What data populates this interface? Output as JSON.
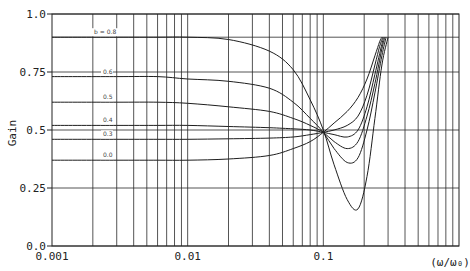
{
  "chart_data": {
    "type": "line",
    "title": "",
    "xlabel": "(ω/ω₀)",
    "ylabel": "Gain",
    "xscale": "log",
    "xlim": [
      0.001,
      1.0
    ],
    "ylim": [
      0.0,
      1.0
    ],
    "grid": true,
    "x_ticks": [
      {
        "value": 0.001,
        "label": "0.001"
      },
      {
        "value": 0.01,
        "label": "0.01"
      },
      {
        "value": 0.1,
        "label": "0.1"
      }
    ],
    "y_ticks": [
      {
        "value": 0.0,
        "label": "0.0"
      },
      {
        "value": 0.25,
        "label": "0.25"
      },
      {
        "value": 0.5,
        "label": "0.5"
      },
      {
        "value": 0.75,
        "label": "0.75"
      },
      {
        "value": 1.0,
        "label": "1.0"
      }
    ],
    "annotation_prefix": "b =",
    "series": [
      {
        "name": "b = 0.8",
        "label": "b = 0.8",
        "x": [
          0.001,
          0.003,
          0.006,
          0.01,
          0.02,
          0.04,
          0.06,
          0.08,
          0.1,
          0.12,
          0.15,
          0.18,
          0.21,
          0.24,
          0.27,
          0.3
        ],
        "y": [
          0.9,
          0.9,
          0.9,
          0.9,
          0.89,
          0.84,
          0.76,
          0.63,
          0.5,
          0.35,
          0.2,
          0.16,
          0.3,
          0.55,
          0.78,
          0.9
        ]
      },
      {
        "name": "b = 0.6",
        "label": "0.6",
        "x": [
          0.001,
          0.003,
          0.006,
          0.01,
          0.02,
          0.04,
          0.06,
          0.08,
          0.1,
          0.12,
          0.15,
          0.18,
          0.21,
          0.24,
          0.27,
          0.29
        ],
        "y": [
          0.73,
          0.73,
          0.73,
          0.72,
          0.71,
          0.68,
          0.62,
          0.55,
          0.49,
          0.42,
          0.36,
          0.38,
          0.5,
          0.66,
          0.82,
          0.9
        ]
      },
      {
        "name": "b = 0.5",
        "label": "0.5",
        "x": [
          0.001,
          0.003,
          0.006,
          0.01,
          0.02,
          0.04,
          0.06,
          0.08,
          0.1,
          0.12,
          0.15,
          0.18,
          0.21,
          0.24,
          0.27,
          0.285
        ],
        "y": [
          0.62,
          0.62,
          0.62,
          0.615,
          0.6,
          0.58,
          0.55,
          0.52,
          0.49,
          0.45,
          0.42,
          0.45,
          0.56,
          0.7,
          0.85,
          0.9
        ]
      },
      {
        "name": "b = 0.4",
        "label": "0.4",
        "x": [
          0.001,
          0.003,
          0.006,
          0.01,
          0.02,
          0.04,
          0.06,
          0.08,
          0.1,
          0.12,
          0.15,
          0.18,
          0.21,
          0.24,
          0.27,
          0.28
        ],
        "y": [
          0.52,
          0.52,
          0.52,
          0.52,
          0.515,
          0.51,
          0.505,
          0.5,
          0.49,
          0.48,
          0.47,
          0.5,
          0.6,
          0.74,
          0.87,
          0.9
        ]
      },
      {
        "name": "b = 0.3",
        "label": "0.3",
        "x": [
          0.001,
          0.003,
          0.006,
          0.01,
          0.02,
          0.04,
          0.06,
          0.08,
          0.1,
          0.12,
          0.15,
          0.18,
          0.21,
          0.24,
          0.26,
          0.275
        ],
        "y": [
          0.46,
          0.46,
          0.46,
          0.46,
          0.462,
          0.465,
          0.47,
          0.48,
          0.49,
          0.5,
          0.52,
          0.56,
          0.65,
          0.78,
          0.86,
          0.9
        ]
      },
      {
        "name": "b = 0.0",
        "label": "0.0",
        "x": [
          0.001,
          0.003,
          0.006,
          0.01,
          0.02,
          0.04,
          0.06,
          0.08,
          0.1,
          0.12,
          0.15,
          0.18,
          0.21,
          0.24,
          0.26,
          0.27
        ],
        "y": [
          0.37,
          0.37,
          0.37,
          0.37,
          0.375,
          0.39,
          0.42,
          0.45,
          0.49,
          0.53,
          0.58,
          0.64,
          0.72,
          0.82,
          0.88,
          0.9
        ]
      }
    ]
  },
  "axes": {
    "ylabel": "Gain",
    "xlabel": "(ω/ω₀)"
  }
}
